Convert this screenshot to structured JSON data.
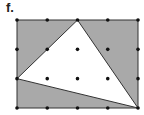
{
  "label": "f.",
  "colors": {
    "shade": "#a9a9a9",
    "triangle_fill": "#ffffff",
    "stroke": "#333333",
    "dot": "#111111"
  },
  "grid": {
    "columns": 5,
    "rows": 4,
    "x": [
      17,
      47.25,
      77.5,
      107.75,
      138
    ],
    "y": [
      20,
      49.33,
      78.67,
      108
    ]
  },
  "rectangle": {
    "x": 17,
    "y": 20,
    "width": 121,
    "height": 88
  },
  "triangle": {
    "vertices": [
      {
        "name": "top",
        "col": 2,
        "row": 0
      },
      {
        "name": "left",
        "col": 0,
        "row": 2
      },
      {
        "name": "bottom-right",
        "col": 4,
        "row": 3
      }
    ]
  }
}
